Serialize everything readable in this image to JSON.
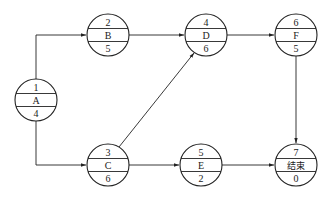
{
  "diagram": {
    "type": "activity-on-node network",
    "stroke_color": "#222222",
    "background": "#ffffff",
    "nodes": [
      {
        "id": "A",
        "top": "1",
        "name": "A",
        "bottom": "4",
        "cx": 36,
        "cy": 100
      },
      {
        "id": "B",
        "top": "2",
        "name": "B",
        "bottom": "5",
        "cx": 108,
        "cy": 35
      },
      {
        "id": "C",
        "top": "3",
        "name": "C",
        "bottom": "6",
        "cx": 108,
        "cy": 165
      },
      {
        "id": "D",
        "top": "4",
        "name": "D",
        "bottom": "6",
        "cx": 206,
        "cy": 35
      },
      {
        "id": "E",
        "top": "5",
        "name": "E",
        "bottom": "2",
        "cx": 201,
        "cy": 165
      },
      {
        "id": "F",
        "top": "6",
        "name": "F",
        "bottom": "5",
        "cx": 296,
        "cy": 35
      },
      {
        "id": "END",
        "top": "7",
        "name": "结束",
        "bottom": "0",
        "cx": 296,
        "cy": 165
      }
    ],
    "edges": [
      {
        "from": "A",
        "to": "B",
        "route": "elbow-up"
      },
      {
        "from": "A",
        "to": "C",
        "route": "elbow-down"
      },
      {
        "from": "B",
        "to": "D",
        "route": "straight"
      },
      {
        "from": "C",
        "to": "D",
        "route": "diagonal"
      },
      {
        "from": "C",
        "to": "E",
        "route": "straight"
      },
      {
        "from": "D",
        "to": "F",
        "route": "straight"
      },
      {
        "from": "E",
        "to": "END",
        "route": "straight"
      },
      {
        "from": "F",
        "to": "END",
        "route": "vertical"
      }
    ]
  }
}
